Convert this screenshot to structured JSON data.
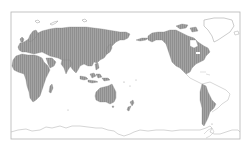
{
  "map": {
    "projection": "equirectangular, Pacific-centered",
    "colors": {
      "background": "#ffffff",
      "frame": "#b4b4b4",
      "shaded_land": "#9a9a9a",
      "shaded_stroke": "#7a7a7a",
      "unshaded_land_stroke": "#bdbdbd"
    },
    "shaded_regions": [
      "Europe",
      "Asia",
      "Africa",
      "Australia",
      "New Zealand",
      "Indonesia",
      "Japan",
      "Alaska",
      "Canada",
      "United States",
      "Mexico",
      "Western South America",
      "Southern South America"
    ],
    "unshaded_regions": [
      "Greenland",
      "Arctic islands",
      "Central America",
      "Eastern South America",
      "Antarctica"
    ]
  }
}
